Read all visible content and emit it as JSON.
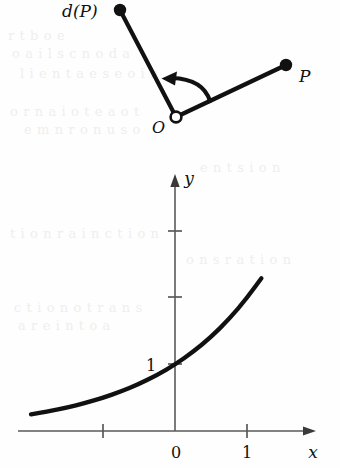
{
  "page": {
    "background_color": "#fefefe",
    "ink_color": "#111111",
    "width": 340,
    "height": 468
  },
  "figure_top": {
    "name": "rotation-diagram",
    "labels": {
      "image_point": "d(P)",
      "origin": "O",
      "source_point": "P"
    },
    "points": {
      "image_point_dot": {
        "x": 120,
        "y": 10,
        "r": 6
      },
      "origin_circle": {
        "x": 176,
        "y": 117,
        "r": 5.5
      },
      "source_point_dot": {
        "x": 286,
        "y": 65,
        "r": 6
      }
    },
    "label_positions": {
      "image_point": {
        "x": 62,
        "y": 17
      },
      "origin": {
        "x": 152,
        "y": 133
      },
      "source_point": {
        "x": 299,
        "y": 82
      }
    },
    "segments": [
      {
        "name": "origin-to-image",
        "x1": 176,
        "y1": 117,
        "x2": 120,
        "y2": 10
      },
      {
        "name": "origin-to-source",
        "x1": 176,
        "y1": 117,
        "x2": 286,
        "y2": 65
      }
    ],
    "arrow": {
      "name": "rotation-arrow",
      "path": "M 209 99 Q 200 78 170 79",
      "tip": {
        "x": 162,
        "y": 79
      }
    }
  },
  "chart_data": {
    "type": "line",
    "title": "",
    "xlabel": "x",
    "ylabel": "y",
    "function": "y = 2^x",
    "grid": false,
    "legend": null,
    "xlim": [
      -2.0,
      1.9
    ],
    "ylim": [
      -0.1,
      3.6
    ],
    "x_ticks": [
      -1,
      0,
      1
    ],
    "x_tick_labels": [
      "",
      "0",
      "1"
    ],
    "y_ticks": [
      1,
      2,
      3
    ],
    "y_tick_labels": [
      "1",
      "",
      ""
    ],
    "axis_labels": {
      "x": "x",
      "y": "y"
    },
    "origin_label": "0",
    "y_intercept_label": "1",
    "x_unit_label": "1",
    "points": [
      {
        "x": -2.0,
        "y": 0.25
      },
      {
        "x": -1.75,
        "y": 0.297
      },
      {
        "x": -1.5,
        "y": 0.354
      },
      {
        "x": -1.25,
        "y": 0.42
      },
      {
        "x": -1.0,
        "y": 0.5
      },
      {
        "x": -0.75,
        "y": 0.595
      },
      {
        "x": -0.5,
        "y": 0.707
      },
      {
        "x": -0.25,
        "y": 0.841
      },
      {
        "x": 0.0,
        "y": 1.0
      },
      {
        "x": 0.25,
        "y": 1.189
      },
      {
        "x": 0.5,
        "y": 1.414
      },
      {
        "x": 0.75,
        "y": 1.682
      },
      {
        "x": 1.0,
        "y": 2.0
      },
      {
        "x": 1.25,
        "y": 2.378
      },
      {
        "x": 1.5,
        "y": 2.828
      },
      {
        "x": 1.2,
        "y": 2.297
      }
    ],
    "pixel_mapping": {
      "x_origin_px": 175,
      "y_origin_px": 431,
      "x_unit_px": 72,
      "y_unit_px": 66.5
    },
    "curve_pixel_path": "M 32 421 C 70 414 104 404 140 387 C 164 376 186 358 208 330 C 228 304 246 265 262 210"
  },
  "axes": {
    "x_axis": {
      "x1": 18,
      "y1": 431,
      "x2": 312,
      "y2": 431
    },
    "y_axis": {
      "x1": 175,
      "y1": 431,
      "x2": 175,
      "y2": 178
    },
    "x_arrow_tip": {
      "x": 316,
      "y": 431
    },
    "y_arrow_tip": {
      "x": 175,
      "y": 174
    },
    "tick_half_len": 7
  },
  "ghost_text": {
    "note": "faint bleed-through from reverse page",
    "lines": [
      {
        "text": "r t   b     o e",
        "x": 8,
        "y": 28
      },
      {
        "text": "o     a   i  l   s   c  n    o  d a",
        "x": 12,
        "y": 46
      },
      {
        "text": "l   i  e   n  t  a   e  s   e  o  i  n",
        "x": 20,
        "y": 66
      },
      {
        "text": "o  r   n a  i   o  t e   a   o  t",
        "x": 10,
        "y": 104
      },
      {
        "text": "e   m  n  r  o  n   u s  o",
        "x": 24,
        "y": 122
      },
      {
        "text": "t  i  o  n  r  a  i n  c  t  i o  n",
        "x": 10,
        "y": 226
      },
      {
        "text": "c  t  i   o  n   o   t   r  a  n  s",
        "x": 14,
        "y": 300
      },
      {
        "text": "a   r  e    i  n   t   o   a",
        "x": 18,
        "y": 318
      },
      {
        "text": "o   n  s    r  a   t   i   o   n",
        "x": 186,
        "y": 252
      },
      {
        "text": "e  n   t    s   i   o  n",
        "x": 200,
        "y": 160
      }
    ]
  }
}
